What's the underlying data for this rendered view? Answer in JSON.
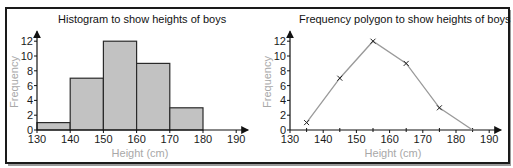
{
  "chart_data": [
    {
      "type": "bar",
      "subtype": "histogram",
      "title": "Histogram to show heights of boys",
      "xlabel": "Height (cm)",
      "ylabel": "Frequency",
      "x_ticks": [
        "130",
        "140",
        "150",
        "160",
        "170",
        "180",
        "190"
      ],
      "y_ticks": [
        "0",
        "2",
        "4",
        "6",
        "8",
        "10",
        "12"
      ],
      "xlim": [
        130,
        190
      ],
      "ylim": [
        0,
        12
      ],
      "grid": false,
      "bins": [
        {
          "from": 130,
          "to": 140,
          "frequency": 1
        },
        {
          "from": 140,
          "to": 150,
          "frequency": 7
        },
        {
          "from": 150,
          "to": 160,
          "frequency": 12
        },
        {
          "from": 160,
          "to": 170,
          "frequency": 9
        },
        {
          "from": 170,
          "to": 180,
          "frequency": 3
        }
      ],
      "categories": [
        "130-140",
        "140-150",
        "150-160",
        "160-170",
        "170-180"
      ],
      "values": [
        1,
        7,
        12,
        9,
        3
      ],
      "colors": {
        "bar_fill": "#c2c2c2",
        "bar_stroke": "#2a2a2a"
      }
    },
    {
      "type": "line",
      "subtype": "frequency-polygon",
      "title": "Frequency polygon to show heights of boys",
      "xlabel": "Height (cm)",
      "ylabel": "Frequency",
      "x_ticks": [
        "130",
        "140",
        "150",
        "160",
        "170",
        "180",
        "190"
      ],
      "y_ticks": [
        "0",
        "2",
        "4",
        "6",
        "8",
        "10",
        "12"
      ],
      "xlim": [
        130,
        190
      ],
      "ylim": [
        0,
        12
      ],
      "grid": false,
      "x": [
        135,
        145,
        155,
        165,
        175,
        185
      ],
      "values": [
        1,
        7,
        12,
        9,
        3,
        0
      ],
      "markers": "x (except final point at 185,0)",
      "colors": {
        "line": "#9a9a9a",
        "marker": "#222222"
      }
    }
  ]
}
